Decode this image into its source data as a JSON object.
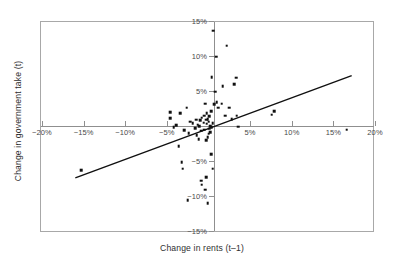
{
  "chart_data": {
    "type": "scatter",
    "title": "",
    "xlabel": "Change in rents (t–1)",
    "ylabel": "Change in government take (t)",
    "xlim": [
      -20,
      20
    ],
    "ylim": [
      -15,
      15
    ],
    "x_unit": "%",
    "y_unit": "%",
    "grid": false,
    "legend": "none",
    "xticks": [
      -20,
      -15,
      -10,
      -5,
      5,
      10,
      15,
      20
    ],
    "xtick_labels": [
      "−20%",
      "−15%",
      "−10%",
      "−5%",
      "5%",
      "10%",
      "15%",
      "20%"
    ],
    "yticks": [
      15,
      10,
      5,
      -5,
      -10,
      -15
    ],
    "ytick_labels": [
      "15%",
      "10%",
      "5%",
      "−5%",
      "−10%",
      "−15%"
    ],
    "axes_style": "crossed-axes-at-origin-inside-box-frame",
    "marker": "square",
    "marker_color": "#101010",
    "frame_color": "#a8a8a8",
    "axis_color": "#8f8f8f",
    "trendline": {
      "type": "linear",
      "color": "#101010",
      "x_start": -16.0,
      "y_start": -7.4,
      "x_end": 17.2,
      "y_end": 7.2
    },
    "points": [
      [
        -15.3,
        -6.3
      ],
      [
        -4.6,
        2.0
      ],
      [
        -4.6,
        1.1
      ],
      [
        -4.2,
        -0.2
      ],
      [
        -3.9,
        0.1
      ],
      [
        -3.6,
        -2.9
      ],
      [
        -3.2,
        -5.2
      ],
      [
        -3.1,
        -6.1
      ],
      [
        -2.9,
        -0.6
      ],
      [
        -2.6,
        2.6
      ],
      [
        -2.4,
        -1.0
      ],
      [
        -2.2,
        0.6
      ],
      [
        -1.9,
        0.4
      ],
      [
        -1.6,
        -0.3
      ],
      [
        -1.5,
        0.9
      ],
      [
        -1.4,
        -1.3
      ],
      [
        -1.3,
        0.2
      ],
      [
        -1.2,
        -1.9
      ],
      [
        -1.1,
        0.0
      ],
      [
        -1.0,
        0.8
      ],
      [
        -0.9,
        -0.7
      ],
      [
        -0.8,
        1.2
      ],
      [
        -0.8,
        -8.4
      ],
      [
        -0.6,
        0.5
      ],
      [
        -0.5,
        1.5
      ],
      [
        -0.5,
        -0.5
      ],
      [
        -0.4,
        3.2
      ],
      [
        -0.4,
        -9.1
      ],
      [
        -0.3,
        0.9
      ],
      [
        -0.3,
        -2.0
      ],
      [
        -0.2,
        1.8
      ],
      [
        -0.2,
        0.3
      ],
      [
        -0.1,
        1.0
      ],
      [
        -0.1,
        -1.6
      ],
      [
        0.0,
        0.6
      ],
      [
        0.0,
        -1.1
      ],
      [
        0.1,
        1.4
      ],
      [
        0.2,
        0.0
      ],
      [
        0.2,
        -0.9
      ],
      [
        0.3,
        2.1
      ],
      [
        0.3,
        -4.0
      ],
      [
        0.4,
        7.0
      ],
      [
        0.5,
        0.4
      ],
      [
        0.5,
        -6.1
      ],
      [
        0.6,
        13.6
      ],
      [
        0.7,
        3.1
      ],
      [
        0.8,
        4.9
      ],
      [
        0.9,
        9.9
      ],
      [
        1.0,
        3.4
      ],
      [
        1.2,
        2.6
      ],
      [
        1.6,
        3.2
      ],
      [
        1.7,
        5.7
      ],
      [
        2.0,
        1.5
      ],
      [
        2.2,
        11.5
      ],
      [
        2.5,
        2.6
      ],
      [
        2.8,
        1.0
      ],
      [
        3.1,
        6.0
      ],
      [
        3.3,
        6.9
      ],
      [
        3.4,
        1.5
      ],
      [
        3.6,
        -0.1
      ],
      [
        -2.5,
        -10.6
      ],
      [
        -0.9,
        -7.8
      ],
      [
        -0.3,
        -7.3
      ],
      [
        -0.1,
        -11.0
      ],
      [
        7.9,
        2.1
      ],
      [
        7.6,
        1.6
      ],
      [
        16.6,
        -0.5
      ],
      [
        -3.4,
        1.8
      ],
      [
        0.1,
        -0.4
      ],
      [
        0.4,
        -0.2
      ]
    ]
  }
}
